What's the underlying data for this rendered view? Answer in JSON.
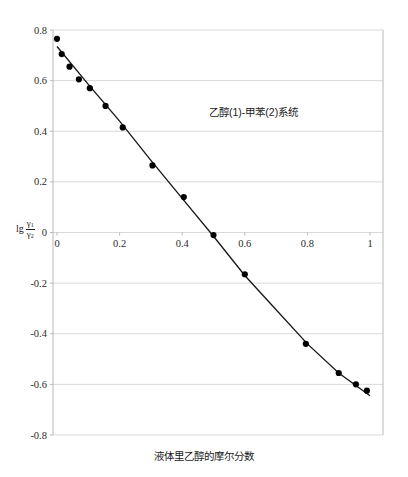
{
  "chart_data": {
    "type": "scatter",
    "title": "",
    "annotation": "乙醇(1)-甲苯(2)系统",
    "xlabel": "液体里乙醇的摩尔分数",
    "ylabel": "lg γ1/γ2",
    "ylabel_parts": {
      "prefix": "lg",
      "numerator": "γ1",
      "denominator": "γ2"
    },
    "xlim": [
      0,
      1
    ],
    "ylim": [
      -0.8,
      0.8
    ],
    "xticks": [
      "0",
      "0.2",
      "0.4",
      "0.6",
      "0.8",
      "1"
    ],
    "xtick_values": [
      0,
      0.2,
      0.4,
      0.6,
      0.8,
      1
    ],
    "yticks": [
      "0.8",
      "0.6",
      "0.4",
      "0.2",
      "0",
      "-0.2",
      "-0.4",
      "-0.6",
      "-0.8"
    ],
    "ytick_values": [
      0.8,
      0.6,
      0.4,
      0.2,
      0,
      -0.2,
      -0.4,
      -0.6,
      -0.8
    ],
    "grid": "horizontal",
    "legend": "none",
    "marker_color": "#000000",
    "line_color": "#1a1a1a",
    "grid_color": "#d9d9d9",
    "x": [
      0.0,
      0.015,
      0.04,
      0.07,
      0.105,
      0.155,
      0.21,
      0.305,
      0.405,
      0.5,
      0.6,
      0.795,
      0.9,
      0.955,
      0.99
    ],
    "y": [
      0.765,
      0.705,
      0.655,
      0.605,
      0.57,
      0.5,
      0.415,
      0.265,
      0.14,
      -0.01,
      -0.165,
      -0.44,
      -0.555,
      -0.6,
      -0.625
    ],
    "fit_line": {
      "x": [
        0.0,
        0.1,
        0.2,
        0.3,
        0.4,
        0.5,
        0.6,
        0.7,
        0.8,
        0.9,
        1.0
      ],
      "y": [
        0.735,
        0.585,
        0.44,
        0.285,
        0.135,
        -0.015,
        -0.17,
        -0.305,
        -0.44,
        -0.555,
        -0.645
      ]
    }
  }
}
